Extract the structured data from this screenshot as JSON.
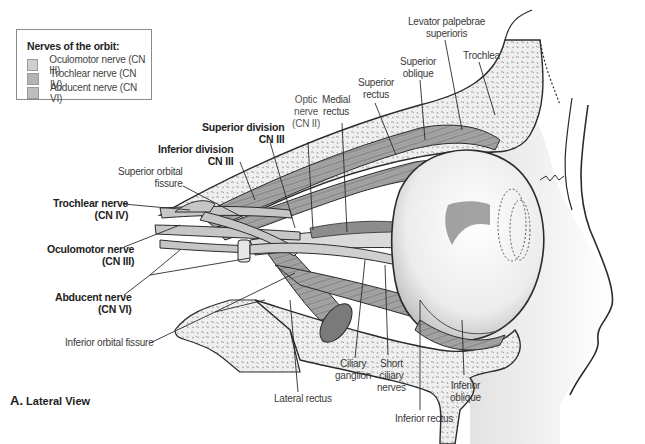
{
  "legend": {
    "title": "Nerves of the orbit:",
    "items": [
      {
        "label": "Oculomotor nerve (CN III)",
        "color": "#cfcfcf"
      },
      {
        "label": "Trochlear nerve (CN IV)",
        "color": "#b4b4b4"
      },
      {
        "label": "Abducent nerve (CN VI)",
        "color": "#bdbdbd"
      }
    ]
  },
  "caption": {
    "letter": "A.",
    "text": "Lateral View"
  },
  "labels": {
    "levator_palpebrae_superioris": "Levator palpebrae\nsuperioris",
    "trochlea": "Trochlea",
    "superior_oblique": "Superior\noblique",
    "superior_rectus": "Superior\nrectus",
    "medial_rectus": "Medial\nrectus",
    "optic_nerve": "Optic\nnerve\n(CN II)",
    "superior_division": "Superior division\nCN III",
    "inferior_division": "Inferior division\nCN III",
    "superior_orbital_fissure": "Superior orbital\nfissure",
    "trochlear_nerve": "Trochlear nerve\n(CN IV)",
    "oculomotor_nerve": "Oculomotor nerve\n(CN III)",
    "abducent_nerve": "Abducent nerve\n(CN VI)",
    "inferior_orbital_fissure": "Inferior orbital fissure",
    "lateral_rectus": "Lateral rectus",
    "ciliary_ganglion": "Ciliary\nganglion",
    "short_ciliary_nerves": "Short\nciliary\nnerves",
    "inferior_rectus": "Inferior rectus",
    "inferior_oblique": "Inferior\noblique",
    "bone_text": "MACER"
  },
  "colors": {
    "line": "#2b2b2b",
    "bone_fill": "#ececec",
    "muscle_fill": "#9a9a9a",
    "nerve_fill": "#c4c4c4",
    "eyeball_fill": "#f4f4f4"
  }
}
